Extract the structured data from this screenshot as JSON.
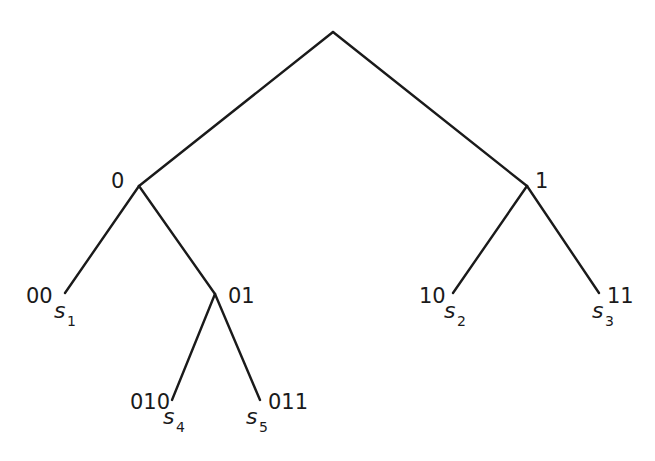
{
  "diagram": {
    "type": "binary-code-tree",
    "nodes": [
      {
        "id": "root",
        "label": "",
        "x": 333,
        "y": 32
      },
      {
        "id": "0",
        "label": "0",
        "x": 139,
        "y": 186
      },
      {
        "id": "1",
        "label": "1",
        "x": 527,
        "y": 186
      },
      {
        "id": "00",
        "label": "00",
        "x": 65,
        "y": 293,
        "symbol": "s",
        "symbol_index": "1"
      },
      {
        "id": "01",
        "label": "01",
        "x": 215,
        "y": 294
      },
      {
        "id": "10",
        "label": "10",
        "x": 453,
        "y": 293,
        "symbol": "s",
        "symbol_index": "2"
      },
      {
        "id": "11",
        "label": "11",
        "x": 599,
        "y": 293,
        "symbol": "s",
        "symbol_index": "3"
      },
      {
        "id": "010",
        "label": "010",
        "x": 172,
        "y": 400,
        "symbol": "s",
        "symbol_index": "4"
      },
      {
        "id": "011",
        "label": "011",
        "x": 260,
        "y": 400,
        "symbol": "s",
        "symbol_index": "5"
      }
    ],
    "edges": [
      [
        "root",
        "0"
      ],
      [
        "root",
        "1"
      ],
      [
        "0",
        "00"
      ],
      [
        "0",
        "01"
      ],
      [
        "1",
        "10"
      ],
      [
        "1",
        "11"
      ],
      [
        "01",
        "010"
      ],
      [
        "01",
        "011"
      ]
    ],
    "labels": {
      "n0": "0",
      "n1": "1",
      "n00": "00",
      "n01": "01",
      "n10": "10",
      "n11": "11",
      "n010": "010",
      "n011": "011"
    },
    "symbols": {
      "s1": {
        "base": "s",
        "index": "1"
      },
      "s2": {
        "base": "s",
        "index": "2"
      },
      "s3": {
        "base": "s",
        "index": "3"
      },
      "s4": {
        "base": "s",
        "index": "4"
      },
      "s5": {
        "base": "s",
        "index": "5"
      }
    },
    "colors": {
      "line": "#1a1a1a",
      "text": "#1a1a1a",
      "background": "#ffffff"
    }
  }
}
